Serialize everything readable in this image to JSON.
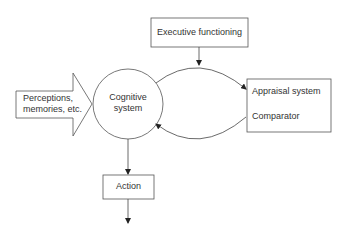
{
  "diagram": {
    "nodes": {
      "input": {
        "label_line1": "Perceptions,",
        "label_line2": "memories, etc.",
        "shape": "block-arrow"
      },
      "cognitive": {
        "label_line1": "Cognitive",
        "label_line2": "system",
        "shape": "circle"
      },
      "executive": {
        "label": "Executive functioning",
        "shape": "rectangle"
      },
      "appraisal": {
        "label_line1": "Appraisal system",
        "label_line2": "Comparator",
        "shape": "rectangle"
      },
      "action": {
        "label": "Action",
        "shape": "rectangle"
      }
    },
    "edges": [
      {
        "from": "input",
        "to": "cognitive",
        "type": "block-arrow"
      },
      {
        "from": "cognitive",
        "to": "appraisal",
        "type": "curved-arrow"
      },
      {
        "from": "appraisal",
        "to": "cognitive",
        "type": "curved-arrow"
      },
      {
        "from": "executive",
        "to": "cognitive-appraisal-loop",
        "type": "arrow"
      },
      {
        "from": "cognitive",
        "to": "action",
        "type": "arrow"
      },
      {
        "from": "action",
        "to": "output",
        "type": "arrow"
      }
    ],
    "colors": {
      "stroke": "#444444",
      "text": "#333333",
      "background": "#ffffff"
    }
  }
}
